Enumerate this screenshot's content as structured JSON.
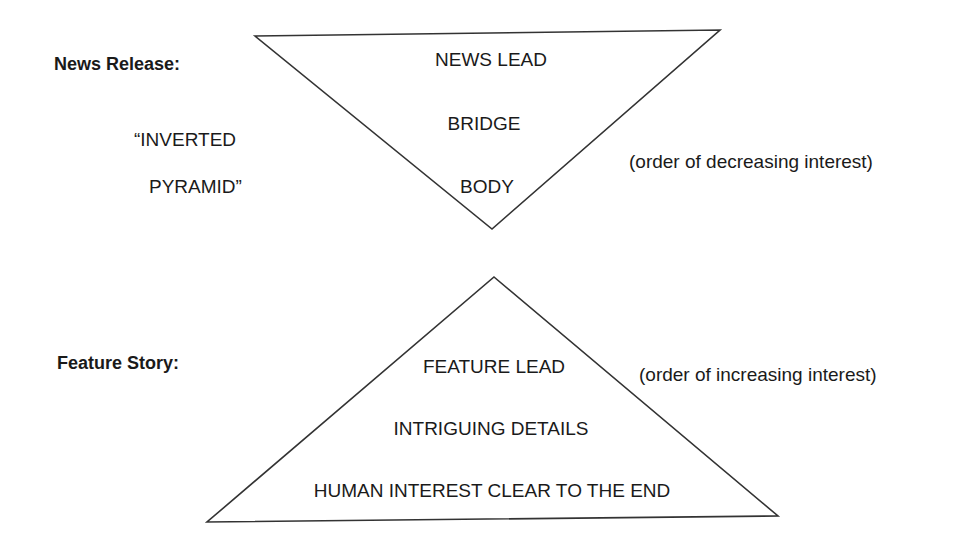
{
  "news_release": {
    "label": "News Release:",
    "nickname_line1": "“INVERTED",
    "nickname_line2": "PYRAMID”",
    "levels": [
      "NEWS LEAD",
      "BRIDGE",
      "BODY"
    ],
    "note": "(order of decreasing interest)"
  },
  "feature_story": {
    "label": "Feature Story:",
    "levels": [
      "FEATURE LEAD",
      "INTRIGUING DETAILS",
      "HUMAN INTEREST CLEAR TO THE END"
    ],
    "note": "(order of increasing interest)"
  },
  "colors": {
    "line": "#333333",
    "text": "#1a1a1a",
    "background": "#ffffff"
  }
}
